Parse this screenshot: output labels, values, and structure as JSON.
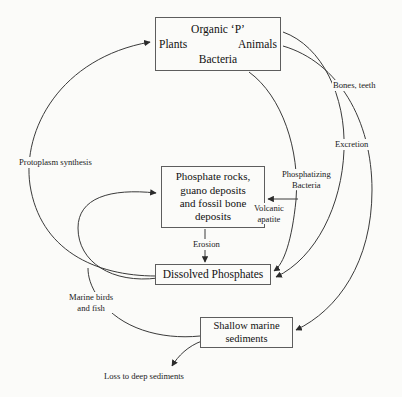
{
  "diagram": {
    "background_color": "#fbfbf9",
    "stroke_color": "#3a3a3a",
    "text_color": "#111111",
    "nodes": {
      "organic": {
        "line1": "Organic ‘P’",
        "line2_left": "Plants",
        "line2_right": "Animals",
        "line3": "Bacteria"
      },
      "rocks": {
        "line1": "Phosphate rocks,",
        "line2": "guano deposits",
        "line3": "and fossil bone",
        "line4": "deposits"
      },
      "dissolved": {
        "line1": "Dissolved Phosphates"
      },
      "shallow": {
        "line1": "Shallow marine",
        "line2": "sediments"
      }
    },
    "edge_labels": {
      "protoplasm": "Protoplasm synthesis",
      "bones_teeth": "Bones, teeth",
      "excretion": "Excretion",
      "phosphatizing_line1": "Phosphatizing",
      "phosphatizing_line2": "Bacteria",
      "volcanic_line1": "Volcanic",
      "volcanic_line2": "apatite",
      "erosion": "Erosion",
      "marine_line1": "Marine birds",
      "marine_line2": "and fish",
      "loss": "Loss to deep sediments"
    }
  }
}
